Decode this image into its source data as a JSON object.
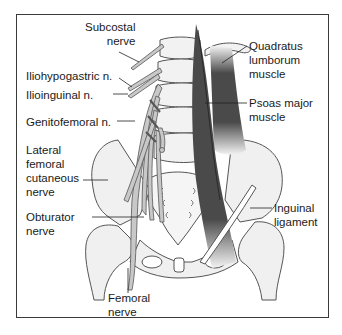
{
  "diagram": {
    "colors": {
      "frame": "#3a3a3a",
      "bone_fill": "#f0f0f0",
      "bone_stroke": "#555555",
      "nerve_fill": "#c8c8c8",
      "muscle_dark": "#4a4a4a",
      "ligament_fill": "#ffffff",
      "text": "#1a1a1a"
    },
    "labels": {
      "subcostal": "Subcostal\nnerve",
      "iliohypogastric": "Iliohypogastric n.",
      "ilioinguinal": "Ilioinguinal n.",
      "genitofemoral": "Genitofemoral n.",
      "lateral_femoral_cutaneous": "Lateral\nfemoral\ncutaneous\nnerve",
      "obturator": "Obturator\nnerve",
      "femoral": "Femoral\nnerve",
      "quadratus_lumborum": "Quadratus\nlumborum\nmuscle",
      "psoas_major": "Psoas major\nmuscle",
      "inguinal_ligament": "Inguinal\nligament"
    }
  }
}
